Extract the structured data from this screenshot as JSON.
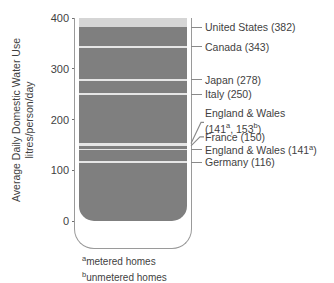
{
  "chart_data": {
    "type": "bar",
    "title": "",
    "subtitle": "",
    "xlabel": "",
    "ylabel": "Average Daily Domestic Water Use litres/person/day",
    "ylabel_line1": "Average Daily Domestic Water Use",
    "ylabel_line2": "litres/person/day",
    "ylim": [
      0,
      400
    ],
    "yticks": [
      0,
      100,
      200,
      300,
      400
    ],
    "ytick_labels": [
      "0",
      "100",
      "200",
      "300",
      "400"
    ],
    "grid": false,
    "legend_position": "right-annotations",
    "units": "litres/person/day",
    "categories": [
      "United States",
      "Canada",
      "Japan",
      "Italy",
      "England & Wales (unmetered)",
      "France",
      "England & Wales (metered)",
      "Germany"
    ],
    "values": [
      382,
      343,
      278,
      250,
      153,
      150,
      141,
      116
    ],
    "bar_top_value": 382,
    "headspace_range": [
      382,
      400
    ],
    "annotations": [
      {
        "id": "united-states",
        "value": 382,
        "text": "United States (382)",
        "line1": "United States (382)",
        "line2": "",
        "connector": "straight"
      },
      {
        "id": "canada",
        "value": 343,
        "text": "Canada (343)",
        "line1": "Canada (343)",
        "line2": "",
        "connector": "straight"
      },
      {
        "id": "japan",
        "value": 278,
        "text": "Japan (278)",
        "line1": "Japan (278)",
        "line2": "",
        "connector": "straight"
      },
      {
        "id": "italy",
        "value": 250,
        "text": "Italy (250)",
        "line1": "Italy (250)",
        "line2": "",
        "connector": "straight"
      },
      {
        "id": "england-wales-both",
        "value": 153,
        "text": "England & Wales (141a, 153b)",
        "line1": "England & Wales",
        "line2_prefix": "(141",
        "line2_sup_a": "a",
        "line2_mid": ", 153",
        "line2_sup_b": "b",
        "line2_suffix": ")",
        "connector": "angled"
      },
      {
        "id": "france",
        "value": 150,
        "text": "France (150)",
        "line1": "France (150)",
        "line2": "",
        "connector": "angled"
      },
      {
        "id": "england-wales-metered",
        "value": 141,
        "text": "England & Wales (141a)",
        "line1_prefix": "England & Wales (141",
        "line1_sup": "a",
        "line1_suffix": ")",
        "connector": "straight"
      },
      {
        "id": "germany",
        "value": 116,
        "text": "Germany (116)",
        "line1": "Germany (116)",
        "line2": "",
        "connector": "straight"
      }
    ],
    "footnotes": [
      {
        "marker": "a",
        "text": "metered homes"
      },
      {
        "marker": "b",
        "text": "unmetered homes"
      }
    ],
    "colors": {
      "water_fill": "#7f7f7f",
      "headspace_fill": "#d5d5d5",
      "gridline": "#e6e6e6",
      "glass_outline": "#9a9a9a",
      "text": "#3f3f3f",
      "background": "#ffffff"
    }
  }
}
